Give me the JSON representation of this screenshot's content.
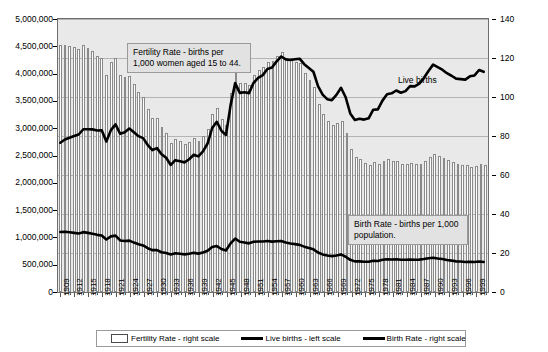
{
  "chart_data": {
    "type": "bar",
    "title": "",
    "xlabel": "",
    "ylabel": "",
    "grid": true,
    "legend_position": "bottom",
    "x": [
      1909,
      1910,
      1911,
      1912,
      1913,
      1914,
      1915,
      1916,
      1917,
      1918,
      1919,
      1920,
      1921,
      1922,
      1923,
      1924,
      1925,
      1926,
      1927,
      1928,
      1929,
      1930,
      1931,
      1932,
      1933,
      1934,
      1935,
      1936,
      1937,
      1938,
      1939,
      1940,
      1941,
      1942,
      1943,
      1944,
      1945,
      1946,
      1947,
      1948,
      1949,
      1950,
      1951,
      1952,
      1953,
      1954,
      1955,
      1956,
      1957,
      1958,
      1959,
      1960,
      1961,
      1962,
      1963,
      1964,
      1965,
      1966,
      1967,
      1968,
      1969,
      1970,
      1971,
      1972,
      1973,
      1974,
      1975,
      1976,
      1977,
      1978,
      1979,
      1980,
      1981,
      1982,
      1983,
      1984,
      1985,
      1986,
      1987,
      1988,
      1989,
      1990,
      1991,
      1992,
      1993,
      1994,
      1995,
      1996,
      1997,
      1998,
      1999,
      2000,
      2001
    ],
    "x_tick_labels": [
      1909,
      1912,
      1915,
      1918,
      1921,
      1924,
      1927,
      1930,
      1933,
      1936,
      1939,
      1942,
      1945,
      1948,
      1951,
      1954,
      1957,
      1960,
      1963,
      1966,
      1969,
      1972,
      1975,
      1978,
      1981,
      1984,
      1987,
      1990,
      1993,
      1996,
      1999
    ],
    "left_axis": {
      "label": "Live births",
      "min": 0,
      "max": 5000000,
      "step": 500000,
      "ticks": [
        "0",
        "500,000",
        "1,000,000",
        "1,500,000",
        "2,000,000",
        "2,500,000",
        "3,000,000",
        "3,500,000",
        "4,000,000",
        "4,500,000",
        "5,000,000"
      ]
    },
    "right_axis": {
      "label": "Rate per 1,000",
      "min": 0,
      "max": 140,
      "step": 20,
      "ticks": [
        "0",
        "20",
        "40",
        "60",
        "80",
        "100",
        "120",
        "140"
      ]
    },
    "series": [
      {
        "name": "Fertility Rate - right scale",
        "type": "bar",
        "axis": "right",
        "values": [
          126.8,
          126.8,
          126.3,
          125.8,
          124.7,
          126.6,
          125.0,
          123.4,
          121.0,
          119.8,
          111.2,
          117.9,
          119.8,
          111.2,
          110.5,
          110.9,
          106.6,
          102.6,
          99.8,
          93.8,
          89.3,
          89.2,
          84.6,
          81.7,
          76.3,
          78.5,
          77.2,
          75.8,
          77.1,
          79.1,
          77.6,
          79.9,
          83.4,
          91.5,
          94.3,
          88.8,
          85.9,
          101.9,
          113.3,
          107.3,
          107.1,
          106.2,
          111.5,
          113.9,
          115.2,
          118.1,
          118.3,
          121.2,
          122.9,
          120.2,
          120.2,
          118.0,
          117.2,
          112.2,
          108.5,
          105.0,
          96.6,
          91.3,
          87.6,
          85.7,
          86.5,
          87.9,
          81.8,
          73.4,
          69.2,
          68.4,
          66.0,
          65.0,
          66.8,
          65.5,
          67.2,
          68.4,
          67.3,
          67.3,
          65.7,
          65.5,
          66.3,
          65.4,
          65.8,
          67.3,
          69.2,
          70.9,
          69.6,
          68.9,
          67.6,
          66.7,
          65.6,
          65.3,
          65.0,
          64.3,
          64.4,
          65.9,
          65.3
        ],
        "color": "#ffffff",
        "edge": "#8a8a8a"
      },
      {
        "name": "Live births - left scale",
        "type": "line",
        "axis": "left",
        "values": [
          2718000,
          2777000,
          2809000,
          2840000,
          2869000,
          2966000,
          2965000,
          2964000,
          2944000,
          2948000,
          2740000,
          2950000,
          3055000,
          2882000,
          2910000,
          2979000,
          2909000,
          2839000,
          2802000,
          2674000,
          2582000,
          2618000,
          2506000,
          2440000,
          2307000,
          2396000,
          2377000,
          2355000,
          2413000,
          2496000,
          2466000,
          2559000,
          2703000,
          2989000,
          3104000,
          2939000,
          2858000,
          3411000,
          3817000,
          3637000,
          3649000,
          3632000,
          3823000,
          3913000,
          3965000,
          4078000,
          4104000,
          4218000,
          4308000,
          4255000,
          4245000,
          4258000,
          4268000,
          4167000,
          4098000,
          4027000,
          3760000,
          3606000,
          3521000,
          3502000,
          3600000,
          3731000,
          3556000,
          3258000,
          3137000,
          3160000,
          3144000,
          3168000,
          3327000,
          3333000,
          3494000,
          3612000,
          3629000,
          3681000,
          3639000,
          3669000,
          3761000,
          3757000,
          3809000,
          3910000,
          4041000,
          4158000,
          4111000,
          4065000,
          4000000,
          3953000,
          3900000,
          3891000,
          3881000,
          3942000,
          3959000,
          4059000,
          4026000
        ],
        "color": "#000000"
      },
      {
        "name": "Birth Rate - right scale",
        "type": "line",
        "axis": "right",
        "values": [
          30.0,
          30.1,
          29.8,
          29.5,
          29.2,
          29.9,
          29.5,
          29.1,
          28.5,
          28.2,
          26.1,
          27.7,
          28.1,
          25.6,
          25.3,
          25.5,
          24.5,
          23.6,
          23.0,
          21.6,
          20.6,
          20.6,
          19.5,
          19.1,
          18.4,
          19.0,
          18.7,
          18.4,
          18.7,
          19.2,
          18.8,
          19.4,
          20.3,
          22.2,
          22.7,
          21.2,
          20.4,
          24.1,
          26.6,
          24.9,
          24.5,
          24.1,
          24.9,
          25.1,
          25.1,
          25.3,
          25.0,
          25.2,
          25.3,
          24.5,
          24.0,
          23.7,
          23.3,
          22.4,
          21.7,
          21.0,
          19.4,
          18.4,
          17.8,
          17.5,
          17.8,
          18.4,
          17.2,
          15.6,
          14.8,
          14.8,
          14.6,
          14.6,
          15.1,
          15.0,
          15.6,
          15.9,
          15.8,
          15.9,
          15.6,
          15.6,
          15.8,
          15.6,
          15.7,
          16.0,
          16.4,
          16.7,
          16.3,
          16.0,
          15.5,
          15.2,
          14.8,
          14.7,
          14.5,
          14.6,
          14.5,
          14.7,
          14.5
        ],
        "color": "#000000"
      }
    ],
    "annotations": [
      {
        "id": "fertility",
        "text": "Fertility Rate - births per 1,000 women aged 15 to 44."
      },
      {
        "id": "birthrate",
        "text": "Birth Rate - births per 1,000 population."
      },
      {
        "id": "livebirths",
        "text": "Live births"
      }
    ],
    "legend": [
      {
        "label": "Fertility Rate - right scale",
        "marker": "box"
      },
      {
        "label": "Live births - left scale",
        "marker": "line"
      },
      {
        "label": "Birth Rate - right scale",
        "marker": "line"
      }
    ]
  }
}
